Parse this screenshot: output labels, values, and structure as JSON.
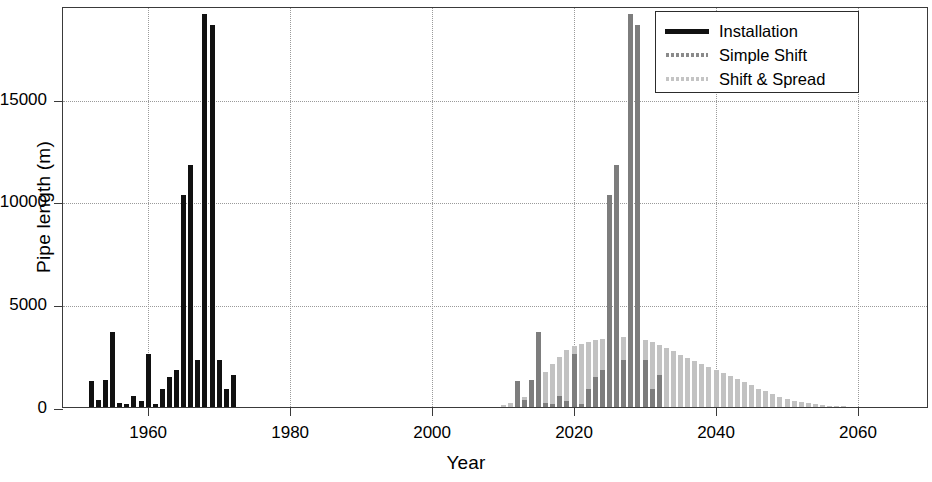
{
  "chart_data": {
    "type": "bar",
    "title": "",
    "xlabel": "Year",
    "ylabel": "Pipe length (m)",
    "xlim": [
      1948,
      2070
    ],
    "ylim": [
      0,
      19500
    ],
    "xticks": [
      1960,
      1980,
      2000,
      2020,
      2040,
      2060
    ],
    "yticks": [
      0,
      5000,
      10000,
      15000
    ],
    "xtick_labels": [
      "1960",
      "1980",
      "2000",
      "2020",
      "2040",
      "2060"
    ],
    "ytick_labels": [
      "0",
      "5000",
      "10000",
      "15000"
    ],
    "grid": true,
    "legend_position": "top-right",
    "legend": [
      "Installation",
      "Simple Shift",
      "Shift & Spread"
    ],
    "colors": {
      "installation": "#111111",
      "simple_shift": "#7d7d7d",
      "shift_and_spread": "#c2c2c2",
      "grid": "#9a9a9a",
      "frame": "#3a3a3a",
      "background": "#ffffff"
    },
    "series": [
      {
        "name": "Installation",
        "color": "#111111",
        "x": [
          1952,
          1953,
          1954,
          1955,
          1956,
          1957,
          1958,
          1959,
          1960,
          1961,
          1962,
          1963,
          1964,
          1965,
          1966,
          1967,
          1968,
          1969,
          1970,
          1971,
          1972
        ],
        "values": [
          1250,
          350,
          1300,
          3650,
          200,
          150,
          550,
          300,
          2600,
          150,
          900,
          1450,
          1800,
          10300,
          11750,
          2300,
          19100,
          18600,
          2300,
          900,
          1550
        ]
      },
      {
        "name": "Simple Shift",
        "color": "#7d7d7d",
        "x": [
          2012,
          2013,
          2014,
          2015,
          2016,
          2017,
          2018,
          2019,
          2020,
          2021,
          2022,
          2023,
          2024,
          2025,
          2026,
          2027,
          2028,
          2029,
          2030,
          2031,
          2032
        ],
        "values": [
          1250,
          350,
          1300,
          3650,
          200,
          150,
          550,
          300,
          2600,
          150,
          900,
          1450,
          1800,
          10300,
          11750,
          2300,
          19100,
          18600,
          2300,
          900,
          1550
        ]
      },
      {
        "name": "Shift & Spread",
        "color": "#c2c2c2",
        "x": [
          2010,
          2011,
          2012,
          2013,
          2014,
          2015,
          2016,
          2017,
          2018,
          2019,
          2020,
          2021,
          2022,
          2023,
          2024,
          2025,
          2026,
          2027,
          2028,
          2029,
          2030,
          2031,
          2032,
          2033,
          2034,
          2035,
          2036,
          2037,
          2038,
          2039,
          2040,
          2041,
          2042,
          2043,
          2044,
          2045,
          2046,
          2047,
          2048,
          2049,
          2050,
          2051,
          2052,
          2053,
          2054,
          2055,
          2056,
          2057,
          2058,
          2059,
          2060
        ],
        "values": [
          120,
          200,
          300,
          500,
          800,
          1250,
          1700,
          2100,
          2450,
          2750,
          2950,
          3050,
          3150,
          3250,
          3300,
          3380,
          3400,
          3400,
          3380,
          3340,
          3280,
          3150,
          3000,
          2850,
          2700,
          2550,
          2400,
          2250,
          2100,
          1950,
          1800,
          1650,
          1500,
          1350,
          1200,
          1050,
          900,
          760,
          620,
          500,
          400,
          310,
          240,
          180,
          130,
          95,
          70,
          50,
          35,
          25,
          18
        ]
      }
    ]
  },
  "axis": {
    "y_title": "Pipe length (m)",
    "x_title": "Year"
  },
  "legend_items": [
    {
      "label": "Installation",
      "style": "solid-thick",
      "icon": "legend-line-solid"
    },
    {
      "label": "Simple Shift",
      "style": "dashed-gray",
      "icon": "legend-line-dashed"
    },
    {
      "label": "Shift & Spread",
      "style": "dashed-light-gray",
      "icon": "legend-line-dashed-light"
    }
  ]
}
